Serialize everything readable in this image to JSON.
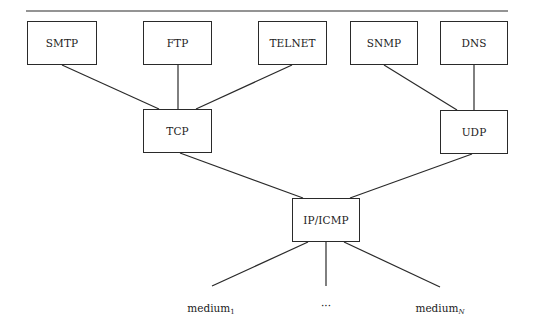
{
  "diagram": {
    "type": "protocol-stack",
    "application_layer": [
      {
        "id": "smtp",
        "label": "SMTP",
        "x": 27,
        "y": 21,
        "w": 70,
        "h": 44
      },
      {
        "id": "ftp",
        "label": "FTP",
        "x": 143,
        "y": 21,
        "w": 69,
        "h": 44
      },
      {
        "id": "telnet",
        "label": "TELNET",
        "x": 258,
        "y": 21,
        "w": 69,
        "h": 44
      },
      {
        "id": "snmp",
        "label": "SNMP",
        "x": 350,
        "y": 21,
        "w": 68,
        "h": 44
      },
      {
        "id": "dns",
        "label": "DNS",
        "x": 440,
        "y": 21,
        "w": 68,
        "h": 44
      }
    ],
    "transport_layer": [
      {
        "id": "tcp",
        "label": "TCP",
        "x": 143,
        "y": 109,
        "w": 69,
        "h": 44
      },
      {
        "id": "udp",
        "label": "UDP",
        "x": 440,
        "y": 110,
        "w": 68,
        "h": 44
      }
    ],
    "network_layer": {
      "id": "ipicmp",
      "label": "IP/ICMP",
      "x": 292,
      "y": 198,
      "w": 68,
      "h": 44
    },
    "media": [
      {
        "id": "medium1",
        "base": "medium",
        "subscript": "1",
        "x": 211,
        "y": 303
      },
      {
        "id": "ellipsis",
        "base": "···",
        "subscript": "",
        "x": 326,
        "y": 302
      },
      {
        "id": "mediumN",
        "base": "medium",
        "subscript": "N",
        "x": 440,
        "y": 303
      }
    ],
    "edges": [
      {
        "from": "smtp",
        "to": "tcp",
        "x1": 62,
        "y1": 65,
        "x2": 159,
        "y2": 109
      },
      {
        "from": "ftp",
        "to": "tcp",
        "x1": 178,
        "y1": 65,
        "x2": 178,
        "y2": 109
      },
      {
        "from": "telnet",
        "to": "tcp",
        "x1": 292,
        "y1": 65,
        "x2": 196,
        "y2": 109
      },
      {
        "from": "snmp",
        "to": "udp",
        "x1": 384,
        "y1": 65,
        "x2": 457,
        "y2": 110
      },
      {
        "from": "dns",
        "to": "udp",
        "x1": 474,
        "y1": 65,
        "x2": 474,
        "y2": 110
      },
      {
        "from": "tcp",
        "to": "ipicmp",
        "x1": 180,
        "y1": 153,
        "x2": 303,
        "y2": 198
      },
      {
        "from": "udp",
        "to": "ipicmp",
        "x1": 472,
        "y1": 154,
        "x2": 350,
        "y2": 198
      },
      {
        "from": "ipicmp",
        "to": "medium1",
        "x1": 308,
        "y1": 242,
        "x2": 212,
        "y2": 286
      },
      {
        "from": "ipicmp",
        "to": "ellipsis",
        "x1": 326,
        "y1": 242,
        "x2": 326,
        "y2": 286
      },
      {
        "from": "ipicmp",
        "to": "mediumN",
        "x1": 344,
        "y1": 242,
        "x2": 440,
        "y2": 287
      }
    ],
    "top_rule": {
      "x1": 26,
      "y1": 11,
      "x2": 508,
      "y2": 11
    },
    "line_color": "#2a2a2a"
  }
}
